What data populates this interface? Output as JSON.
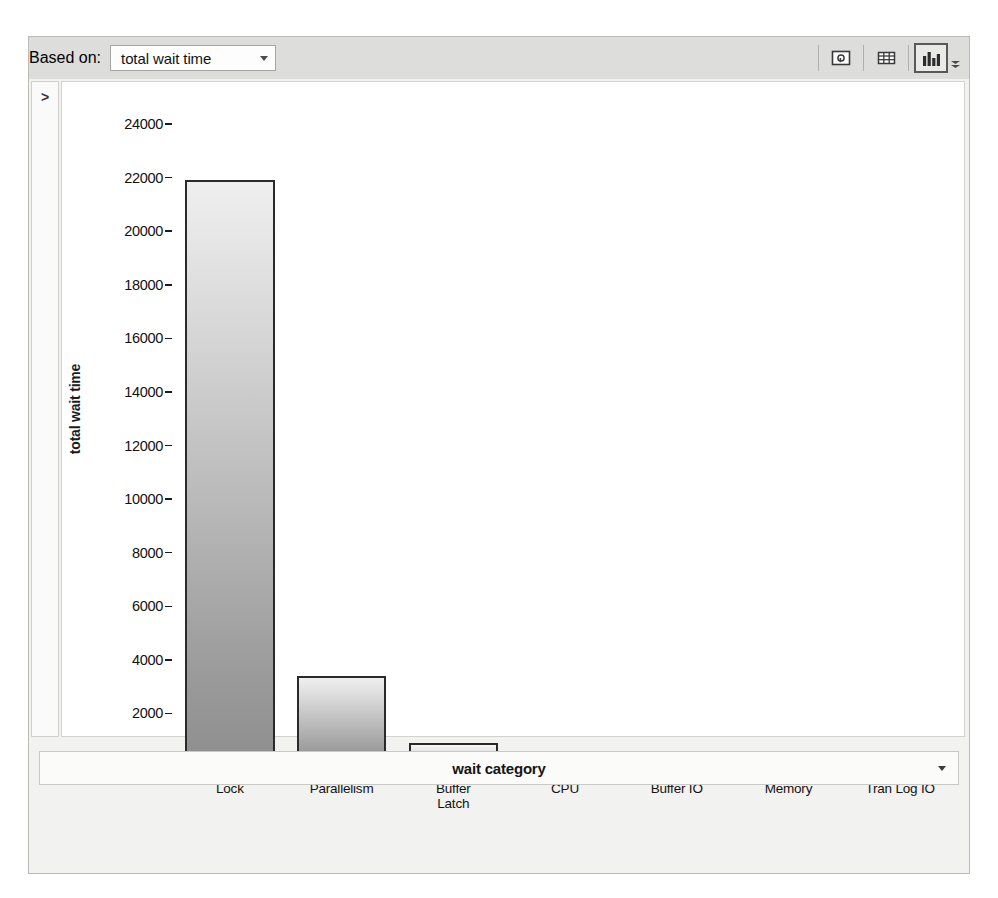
{
  "toolbar": {
    "based_on_label": "Based on:",
    "based_on_value": "total wait time",
    "dropdown_icon": "chevron-down-icon",
    "buttons": [
      {
        "name": "zoom-detail-icon",
        "title": "zoom detail view"
      },
      {
        "name": "grid-table-icon",
        "title": "table view"
      },
      {
        "name": "bar-chart-icon",
        "title": "chart view",
        "pressed": true
      }
    ],
    "overflow_icon": "chevron-down-overflow-icon"
  },
  "left_rail": {
    "expand_icon": ">"
  },
  "xtitle_bar": {
    "label": "wait category",
    "dropdown_icon": "chevron-down-icon"
  },
  "chart_data": {
    "type": "bar",
    "title": "",
    "xlabel": "wait category",
    "ylabel": "total wait time",
    "categories": [
      "Lock",
      "Parallelism",
      "Buffer\nLatch",
      "CPU",
      "Buffer IO",
      "Memory",
      "Tran Log IO"
    ],
    "values": [
      21900,
      3400,
      900,
      400,
      400,
      300,
      130
    ],
    "ylim": [
      0,
      24000
    ],
    "ytick_step": 2000,
    "yticks": [
      24000,
      22000,
      20000,
      18000,
      16000,
      14000,
      12000,
      10000,
      8000,
      6000,
      4000,
      2000,
      0
    ],
    "ytick_labels": [
      "24000",
      "22000",
      "20000",
      "18000",
      "16000",
      "14000",
      "12000",
      "10000",
      "8000",
      "6000",
      "4000",
      "2000",
      "0"
    ],
    "grid": false,
    "legend": null,
    "bar_style": "vertical-gradient-gray-outlined"
  }
}
